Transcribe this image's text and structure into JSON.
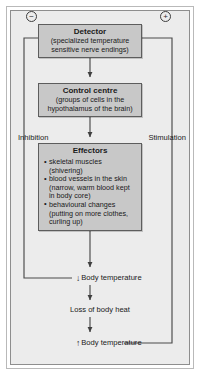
{
  "diagram": {
    "boxes": {
      "detector": {
        "title": "Detector",
        "subtitle_line1": "(specialized temperature",
        "subtitle_line2": "sensitive nerve endings)"
      },
      "control_centre": {
        "title": "Control centre",
        "subtitle_line1": "(groups of cells in the",
        "subtitle_line2": "hypothalamus of the brain)"
      },
      "effectors": {
        "title": "Effectors",
        "items": [
          {
            "main": "skeletal muscles",
            "cont": "(shivering)"
          },
          {
            "main": "blood vessels in the skin",
            "cont": "(narrow, warm blood kept",
            "cont2": "in body core)"
          },
          {
            "main": "behavioural changes",
            "cont": "(putting on more clothes,",
            "cont2": "curling up)"
          }
        ]
      }
    },
    "labels": {
      "inhibition": "Inhibition",
      "stimulation": "Stimulation",
      "body_temp_down_arrow": "↓",
      "body_temp_down": "Body temperature",
      "loss_of_body_heat": "Loss of body heat",
      "body_temp_up_arrow": "↑",
      "body_temp_up2": "Body temperature"
    },
    "symbols": {
      "negative": "−",
      "positive": "+"
    },
    "colors": {
      "box_fill": "#c8c8c8",
      "box_border": "#5d5d5d",
      "background": "#ececec",
      "line": "#4a4a4a",
      "text": "#1a1a1a"
    }
  }
}
